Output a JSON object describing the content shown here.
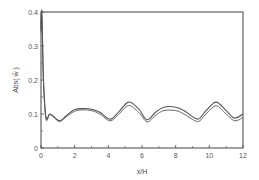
{
  "chart_data": {
    "type": "line",
    "title": "",
    "xlabel": "x/H",
    "ylabel": "Abs( w̄ )",
    "xlim": [
      0,
      12
    ],
    "ylim": [
      0,
      0.4
    ],
    "xticks": [
      0,
      2,
      4,
      6,
      8,
      10,
      12
    ],
    "yticks": [
      0,
      0.1,
      0.2,
      0.3,
      0.4
    ],
    "xtick_labels": [
      "0",
      "2",
      "4",
      "6",
      "8",
      "10",
      "12"
    ],
    "ytick_labels": [
      "0",
      "0.1",
      "0.2",
      "0.3",
      "0.4"
    ],
    "grid": false,
    "legend": null,
    "series": [
      {
        "name": "upper",
        "x": [
          0,
          0.05,
          0.15,
          0.3,
          0.5,
          0.7,
          1.1,
          1.5,
          2.0,
          2.5,
          3.0,
          3.5,
          4.1,
          4.6,
          5.2,
          5.8,
          6.3,
          6.8,
          7.3,
          8.0,
          8.5,
          9.3,
          9.8,
          10.4,
          11.0,
          11.5,
          12.0
        ],
        "y": [
          0.35,
          0.4,
          0.2,
          0.09,
          0.1,
          0.095,
          0.08,
          0.095,
          0.113,
          0.116,
          0.114,
          0.105,
          0.085,
          0.105,
          0.135,
          0.115,
          0.083,
          0.105,
          0.12,
          0.12,
          0.11,
          0.085,
          0.11,
          0.135,
          0.11,
          0.088,
          0.1
        ]
      },
      {
        "name": "lower",
        "x": [
          0,
          0.05,
          0.15,
          0.3,
          0.5,
          0.7,
          1.1,
          1.5,
          2.0,
          2.5,
          3.0,
          3.5,
          4.1,
          4.6,
          5.2,
          5.8,
          6.3,
          6.8,
          7.3,
          8.0,
          8.5,
          9.3,
          9.8,
          10.4,
          11.0,
          11.5,
          12.0
        ],
        "y": [
          0.34,
          0.39,
          0.19,
          0.085,
          0.098,
          0.093,
          0.078,
          0.092,
          0.108,
          0.112,
          0.11,
          0.1,
          0.08,
          0.098,
          0.125,
          0.105,
          0.077,
          0.096,
          0.11,
          0.11,
          0.1,
          0.078,
          0.1,
          0.124,
          0.1,
          0.08,
          0.09
        ]
      }
    ]
  },
  "colors": {
    "line": "#555555",
    "axis": "#333333"
  }
}
